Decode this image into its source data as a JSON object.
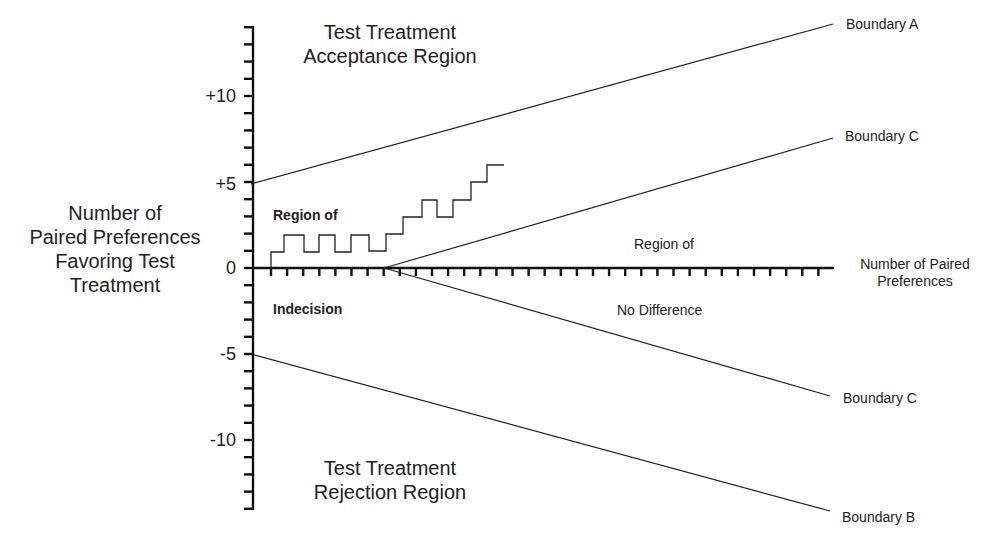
{
  "chart_data": {
    "type": "line",
    "title": "",
    "ylabel": "Number of Paired Preferences Favoring Test Treatment",
    "xlabel": "Number of Paired Preferences",
    "y_ticks": [
      "+10",
      "+5",
      "0",
      "-5",
      "-10"
    ],
    "ylim": [
      -14,
      14
    ],
    "xlim": [
      0,
      36
    ],
    "grid": false,
    "series": [
      {
        "name": "Boundary A",
        "x": [
          0,
          36
        ],
        "y": [
          5,
          14.3
        ]
      },
      {
        "name": "Boundary C (upper)",
        "x": [
          8,
          36
        ],
        "y": [
          0,
          7.6
        ]
      },
      {
        "name": "Boundary C (lower)",
        "x": [
          8,
          36
        ],
        "y": [
          0,
          -7.5
        ]
      },
      {
        "name": "Boundary B",
        "x": [
          0,
          36
        ],
        "y": [
          -5,
          -14.2
        ]
      },
      {
        "name": "Sample path",
        "x": [
          1,
          2,
          3,
          4,
          5,
          6,
          7,
          8,
          9,
          10,
          11,
          12,
          13,
          14,
          15
        ],
        "y": [
          1,
          2,
          1,
          2,
          1,
          2,
          1,
          2,
          3,
          4,
          3,
          4,
          5,
          6,
          6
        ]
      }
    ],
    "annotations": [
      "Test Treatment Acceptance Region",
      "Region of Indecision",
      "Region of No Difference",
      "Test Treatment Rejection Region"
    ]
  },
  "labels": {
    "acceptance_line1": "Test Treatment",
    "acceptance_line2": "Acceptance Region",
    "rejection_line1": "Test Treatment",
    "rejection_line2": "Rejection Region",
    "ylabel_line1": "Number of",
    "ylabel_line2": "Paired Preferences",
    "ylabel_line3": "Favoring Test",
    "ylabel_line4": "Treatment",
    "xlabel_line1": "Number of Paired",
    "xlabel_line2": "Preferences",
    "indecision_top": "Region of",
    "indecision_bottom": "Indecision",
    "nodiff_top": "Region of",
    "nodiff_bottom": "No Difference",
    "boundary_a": "Boundary A",
    "boundary_c_upper": "Boundary C",
    "boundary_c_lower": "Boundary C",
    "boundary_b": "Boundary B",
    "tick_p10": "+10",
    "tick_p5": "+5",
    "tick_0": "0",
    "tick_m5": "-5",
    "tick_m10": "-10"
  },
  "colors": {
    "line": "#222222",
    "axis": "#111111",
    "text": "#222222"
  }
}
